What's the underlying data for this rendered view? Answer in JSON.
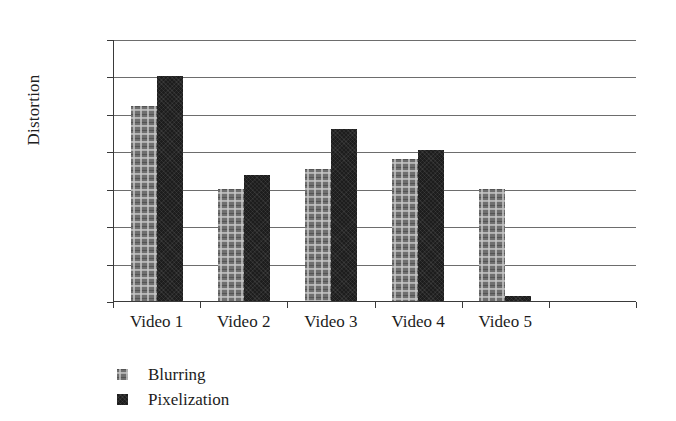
{
  "chart_data": {
    "type": "bar",
    "title": "",
    "xlabel": "",
    "ylabel": "Distortion",
    "categories": [
      "Video 1",
      "Video 2",
      "Video 3",
      "Video 4",
      "Video 5",
      ""
    ],
    "series": [
      {
        "name": "Blurring",
        "color": "#6f6f6f",
        "values": [
          0.26,
          0.15,
          0.177,
          0.19,
          0.15,
          null
        ]
      },
      {
        "name": "Pixelization",
        "color": "#1d1d1d",
        "values": [
          0.3,
          0.168,
          0.23,
          0.202,
          0.007,
          null
        ]
      }
    ],
    "ylim": [
      0,
      0.35
    ],
    "ytick_values": [
      0,
      0.05,
      0.1,
      0.15,
      0.2,
      0.25,
      0.3,
      0.35
    ],
    "ytick_labels": [
      "0",
      "0.05",
      "0.1",
      "0.15",
      "0.2",
      "0.25",
      "0.3",
      "0.35"
    ],
    "grid": "horizontal",
    "legend_position": "bottom-left"
  },
  "axes": {
    "y_title": "Distortion"
  },
  "legend": {
    "items": [
      {
        "label": "Blurring",
        "color": "#6f6f6f"
      },
      {
        "label": "Pixelization",
        "color": "#1d1d1d"
      }
    ]
  }
}
